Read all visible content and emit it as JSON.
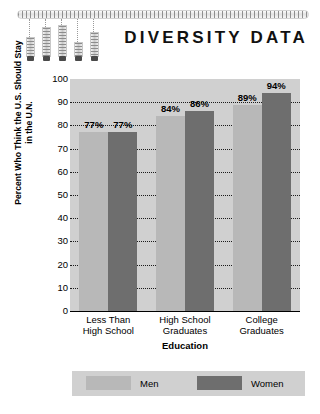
{
  "decor": {
    "top_bar_name": "decorative-ruled-bar",
    "sliders": [
      {
        "stick_height": 20,
        "guide_height": 18
      },
      {
        "stick_height": 30,
        "guide_height": 8
      },
      {
        "stick_height": 32,
        "guide_height": 6
      },
      {
        "stick_height": 15,
        "guide_height": 23
      },
      {
        "stick_height": 25,
        "guide_height": 13
      }
    ]
  },
  "chart_data": {
    "type": "bar",
    "title": "DIVERSITY DATA",
    "xlabel": "Education",
    "ylabel": "Percent Who Think the U.S. Should Stay in the U.N.",
    "categories": [
      "Less Than\nHigh School",
      "High School\nGraduates",
      "College\nGraduates"
    ],
    "category_lines": [
      [
        "Less Than",
        "High School"
      ],
      [
        "High School",
        "Graduates"
      ],
      [
        "College",
        "Graduates"
      ]
    ],
    "series": [
      {
        "name": "Men",
        "color": "#b8b8b8",
        "values": [
          77,
          84,
          89
        ],
        "labels": [
          "77%",
          "84%",
          "89%"
        ]
      },
      {
        "name": "Women",
        "color": "#6e6e6e",
        "values": [
          77,
          86,
          94
        ],
        "labels": [
          "77%",
          "86%",
          "94%"
        ]
      }
    ],
    "ylim": [
      0,
      100
    ],
    "yticks": [
      100,
      90,
      80,
      70,
      60,
      50,
      40,
      30,
      20,
      10,
      0
    ],
    "ytick_labels": [
      "100",
      "90",
      "80",
      "70",
      "60",
      "50",
      "40",
      "30",
      "20",
      "10",
      "0"
    ],
    "grid": true,
    "gridline_style": "dotted",
    "legend_position": "bottom",
    "plot_background": "#d0d0d0"
  }
}
